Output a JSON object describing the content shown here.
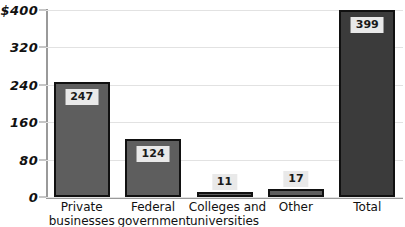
{
  "chart_data": {
    "type": "bar",
    "title": "",
    "xlabel": "",
    "ylabel": "",
    "ylim": [
      0,
      400
    ],
    "yticks": [
      "0",
      "80",
      "160",
      "240",
      "320",
      "$400"
    ],
    "ytick_values": [
      0,
      80,
      160,
      240,
      320,
      400
    ],
    "grid": true,
    "legend": "none",
    "categories": [
      "Private businesses",
      "Federal government",
      "Colleges and universities",
      "Other",
      "Total"
    ],
    "category_lines": [
      [
        "Private",
        "businesses"
      ],
      [
        "Federal",
        "government"
      ],
      [
        "Colleges and",
        "universities"
      ],
      [
        "Other",
        ""
      ],
      [
        "Total",
        ""
      ]
    ],
    "values": [
      247,
      124,
      11,
      17,
      399
    ],
    "value_labels": [
      "247",
      "124",
      "11",
      "17",
      "399"
    ],
    "colors": {
      "bar_fill": "#5e5e5e",
      "bar_total_fill": "#3b3b3b",
      "bar_outline": "#111111",
      "label_box": "#e9e9e9",
      "gridline": "#e2e2e2",
      "axis": "#9a9a9a",
      "background": "#ffffff"
    }
  }
}
